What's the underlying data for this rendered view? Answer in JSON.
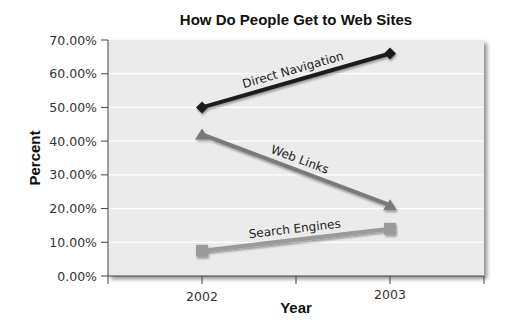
{
  "chart_data": {
    "type": "line",
    "title": "How Do People Get to Web Sites",
    "xlabel": "Year",
    "ylabel": "Percent",
    "categories": [
      "2002",
      "2003"
    ],
    "series": [
      {
        "name": "Direct Navigation",
        "values": [
          50.0,
          66.0
        ],
        "color": "#1f1f1f",
        "marker": "diamond"
      },
      {
        "name": "Web Links",
        "values": [
          42.0,
          21.0
        ],
        "color": "#7a7a7a",
        "marker": "triangle"
      },
      {
        "name": "Search Engines",
        "values": [
          7.5,
          14.0
        ],
        "color": "#9a9a9a",
        "marker": "square"
      }
    ],
    "ylim": [
      0,
      70
    ],
    "yticks": [
      "0.00%",
      "10.00%",
      "20.00%",
      "30.00%",
      "40.00%",
      "50.00%",
      "60.00%",
      "70.00%"
    ],
    "grid": true,
    "legend": "inline labels on lines"
  }
}
